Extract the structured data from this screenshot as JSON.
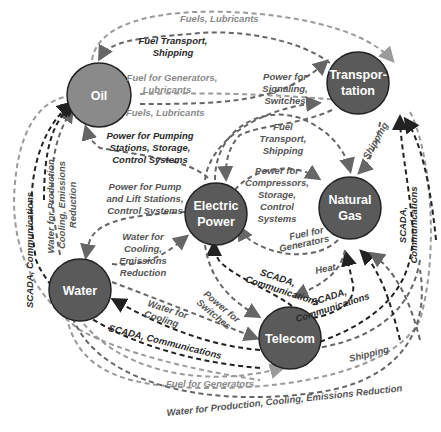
{
  "diagram": {
    "type": "infrastructure-interdependency",
    "colors": {
      "node_oil": "#8a8a8a",
      "node_default": "#5a5a5a",
      "edge_dark": "#222222",
      "edge_mid": "#666666",
      "edge_light": "#9a9a9a",
      "background": "#ffffff"
    },
    "nodes": {
      "oil": {
        "label": "Oil"
      },
      "transportation": {
        "label_line1": "Transpor-",
        "label_line2": "tation"
      },
      "electric_power": {
        "label_line1": "Electric",
        "label_line2": "Power"
      },
      "natural_gas": {
        "label_line1": "Natural",
        "label_line2": "Gas"
      },
      "water": {
        "label": "Water"
      },
      "telecom": {
        "label": "Telecom"
      }
    },
    "edge_labels": {
      "fuels_lubricants_top": "Fuels, Lubricants",
      "fuel_transport_shipping_top_1": "Fuel Transport,",
      "fuel_transport_shipping_top_2": "Shipping",
      "fuel_for_generators_lubricants_1": "Fuel for Generators,",
      "fuel_for_generators_lubricants_2": "Lubricants",
      "fuels_lubricants_mid": "Fuels, Lubricants",
      "power_for_signaling_1": "Power for",
      "power_for_signaling_2": "Signaling,",
      "power_for_signaling_3": "Switches",
      "power_for_pumping_1": "Power for Pumping",
      "power_for_pumping_2": "Stations, Storage,",
      "power_for_pumping_3": "Control Systems",
      "fuel_transport_shipping_mid_1": "Fuel",
      "fuel_transport_shipping_mid_2": "Transport,",
      "fuel_transport_shipping_mid_3": "Shipping",
      "shipping_trans_gas": "Shipping",
      "power_for_pump_lift_1": "Power for Pump",
      "power_for_pump_lift_2": "and Lift Stations,",
      "power_for_pump_lift_3": "Control Systems",
      "power_for_compressors_1": "Power for",
      "power_for_compressors_2": "Compressors,",
      "power_for_compressors_3": "Storage,",
      "power_for_compressors_4": "Control",
      "power_for_compressors_5": "Systems",
      "fuel_for_generators_gas_1": "Fuel for",
      "fuel_for_generators_gas_2": "Generators",
      "water_for_cooling_emissions_1": "Water for",
      "water_for_cooling_emissions_2": "Cooling,",
      "water_for_cooling_emissions_3": "Emissions",
      "water_for_cooling_emissions_4": "Reduction",
      "water_for_production_left_1": "Water for Production,",
      "water_for_production_left_2": "Cooling, Emissions",
      "water_for_production_left_3": "Reduction",
      "scada_left": "SCADA, Communications",
      "scada_right_1": "SCADA,",
      "scada_right_2": "Communications",
      "scada_power_telecom_1": "SCADA,",
      "scada_power_telecom_2": "Communications",
      "scada_gas_telecom_1": "SCADA,",
      "scada_gas_telecom_2": "Communications",
      "heat": "Heat",
      "water_for_cooling_telecom_1": "Water for",
      "water_for_cooling_telecom_2": "Cooling",
      "power_for_switches_1": "Power for",
      "power_for_switches_2": "Switches",
      "scada_water": "SCADA, Communications",
      "shipping_telecom": "Shipping",
      "fuel_for_generators_bottom": "Fuel for Generators",
      "water_for_production_bottom": "Water for Production, Cooling,  Emissions Reduction"
    }
  }
}
